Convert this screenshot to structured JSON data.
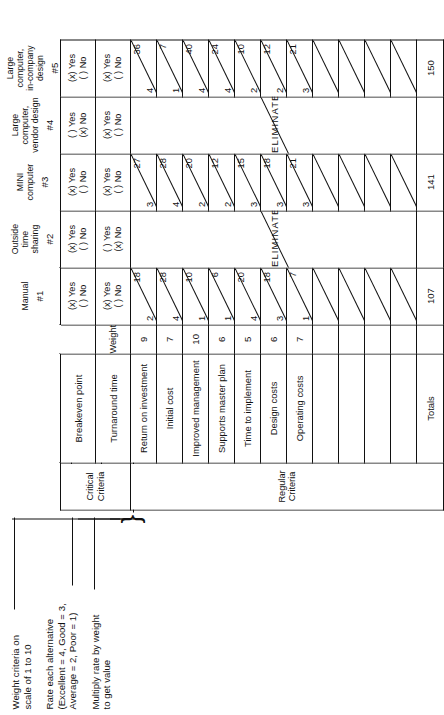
{
  "notes": [
    {
      "id": "note-weight",
      "lines": [
        "Weight criteria on",
        "scale of 1 to 10"
      ]
    },
    {
      "id": "note-rate",
      "lines": [
        "Rate each alternative",
        "(Excellent = 4, Good = 3,",
        "Average = 2, Poor = 1)"
      ]
    },
    {
      "id": "note-multiply",
      "lines": [
        "Multiply rate by weight",
        "to get value"
      ]
    }
  ],
  "corner": {
    "critical_label_line1": "Critical",
    "critical_label_line2": "Criteria",
    "regular_label": "Regular Criteria",
    "weight_header": "Weight"
  },
  "alternatives": [
    {
      "name_lines": [
        "Manual"
      ],
      "number": "#1",
      "eliminated": false
    },
    {
      "name_lines": [
        "Outside",
        "time",
        "sharing"
      ],
      "number": "#2",
      "eliminated": true
    },
    {
      "name_lines": [
        "MINI",
        "computer"
      ],
      "number": "#3",
      "eliminated": false
    },
    {
      "name_lines": [
        "Large computer,",
        "vendor design"
      ],
      "number": "#4",
      "eliminated": true
    },
    {
      "name_lines": [
        "Large computer,",
        "in-company",
        "design"
      ],
      "number": "#5",
      "eliminated": false
    }
  ],
  "critical_criteria": [
    {
      "label": "Breakeven point",
      "answers": [
        {
          "yes": "(x) Yes",
          "no": "( ) No"
        },
        {
          "yes": "(x) Yes",
          "no": "( ) No"
        },
        {
          "yes": "(x) Yes",
          "no": "( ) No"
        },
        {
          "yes": "( ) Yes",
          "no": "(x) No"
        },
        {
          "yes": "(x) Yes",
          "no": "( ) No"
        }
      ]
    },
    {
      "label": "Turnaround time",
      "answers": [
        {
          "yes": "(x) Yes",
          "no": "( ) No"
        },
        {
          "yes": "( ) Yes",
          "no": "(x) No"
        },
        {
          "yes": "(x) Yes",
          "no": "( ) No"
        },
        {
          "yes": "(x) Yes",
          "no": "( ) No"
        },
        {
          "yes": "(x) Yes",
          "no": "( ) No"
        }
      ]
    }
  ],
  "eliminate_label": "ELIMINATE",
  "regular_criteria": [
    {
      "label": "Return on investment",
      "weight": "9"
    },
    {
      "label": "Initial cost",
      "weight": "7"
    },
    {
      "label": "Improved management",
      "weight": "10"
    },
    {
      "label": "Supports master plan",
      "weight": "6"
    },
    {
      "label": "Time to implement",
      "weight": "5"
    },
    {
      "label": "Design costs",
      "weight": "6"
    },
    {
      "label": "Operating costs",
      "weight": "7"
    },
    {
      "label": "",
      "weight": ""
    },
    {
      "label": "",
      "weight": ""
    },
    {
      "label": "",
      "weight": ""
    },
    {
      "label": "",
      "weight": ""
    }
  ],
  "scores": {
    "1": {
      "rates": [
        "2",
        "4",
        "1",
        "1",
        "4",
        "3",
        "1",
        "",
        "",
        "",
        ""
      ],
      "values": [
        "18",
        "28",
        "10",
        "6",
        "20",
        "18",
        "7",
        "",
        "",
        "",
        ""
      ],
      "total": "107"
    },
    "2": {
      "rates": [],
      "values": [],
      "total": ""
    },
    "3": {
      "rates": [
        "3",
        "4",
        "2",
        "2",
        "3",
        "3",
        "3",
        "",
        "",
        "",
        ""
      ],
      "values": [
        "27",
        "28",
        "20",
        "12",
        "15",
        "18",
        "21",
        "",
        "",
        "",
        ""
      ],
      "total": "141"
    },
    "4": {
      "rates": [],
      "values": [],
      "total": ""
    },
    "5": {
      "rates": [
        "4",
        "1",
        "4",
        "4",
        "2",
        "2",
        "3",
        "",
        "",
        "",
        ""
      ],
      "values": [
        "36",
        "7",
        "40",
        "24",
        "10",
        "12",
        "21",
        "",
        "",
        "",
        ""
      ],
      "total": "150"
    }
  },
  "totals_label": "Totals",
  "colors": {
    "ink": "#111111",
    "paper": "#ffffff"
  }
}
